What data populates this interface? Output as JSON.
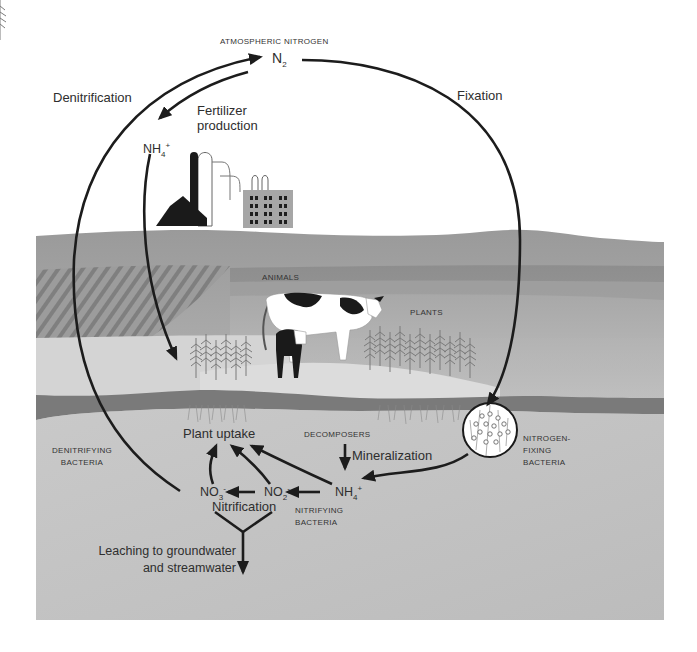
{
  "diagram": {
    "colors": {
      "background": "#ffffff",
      "hill_top": "#bdbdbd",
      "field": "#a9a9a9",
      "pasture": "#cfcfcf",
      "soil_band": "#7c7c7c",
      "soil": "#c4c4c4",
      "arrow": "#1c1c1c",
      "text": "#2e2e2e"
    },
    "labels": {
      "atmospheric_nitrogen": "ATMOSPHERIC NITROGEN",
      "n2": "N",
      "n2_sub": "2",
      "denitrification": "Denitrification",
      "fixation": "Fixation",
      "fertilizer_production_line1": "Fertilizer",
      "fertilizer_production_line2": "production",
      "nh4_fertilizer": "NH",
      "nh4_fertilizer_sub": "4",
      "nh4_fertilizer_sup": "+",
      "animals": "ANIMALS",
      "plants": "PLANTS",
      "plant_uptake": "Plant uptake",
      "decomposers": "DECOMPOSERS",
      "mineralization": "Mineralization",
      "nitrogen_fixing_bacteria_line1": "NITROGEN-",
      "nitrogen_fixing_bacteria_line2": "FIXING",
      "nitrogen_fixing_bacteria_line3": "BACTERIA",
      "denitrifying_bacteria_line1": "DENITRIFYING",
      "denitrifying_bacteria_line2": "BACTERIA",
      "no3": "NO",
      "no3_sub": "3",
      "no3_sup": "-",
      "no2": "NO",
      "no2_sub": "2",
      "no2_sup": "-",
      "nh4_soil": "NH",
      "nh4_soil_sub": "4",
      "nh4_soil_sup": "+",
      "nitrification": "Nitrification",
      "nitrifying_bacteria_line1": "NITRIFYING",
      "nitrifying_bacteria_line2": "BACTERIA",
      "leaching_line1": "Leaching to groundwater",
      "leaching_line2": "and streamwater"
    },
    "icons": [
      "factory-icon",
      "cow-icon",
      "calf-icon",
      "plant-icon",
      "bacteria-circle-icon",
      "arrow-icon"
    ],
    "flows": [
      {
        "from": "N2",
        "to": "NH4+ (fertilizer)",
        "label": "Fertilizer production"
      },
      {
        "from": "N2",
        "to": "Nitrogen-fixing bacteria",
        "label": "Fixation"
      },
      {
        "from": "NO3-",
        "to": "N2",
        "label": "Denitrification"
      },
      {
        "from": "NH4+ (fertilizer)",
        "to": "Plants"
      },
      {
        "from": "Nitrogen-fixing bacteria",
        "to": "NH4+"
      },
      {
        "from": "Decomposers",
        "to": "NH4+",
        "label": "Mineralization"
      },
      {
        "from": "NH4+",
        "to": "NO2-",
        "label": "Nitrification"
      },
      {
        "from": "NO2-",
        "to": "NO3-",
        "label": "Nitrification"
      },
      {
        "from": "NO3-",
        "to": "Plant uptake"
      },
      {
        "from": "NO2-",
        "to": "Plant uptake"
      },
      {
        "from": "NH4+",
        "to": "Plant uptake"
      },
      {
        "from": "NO3-/NO2-",
        "to": "Groundwater",
        "label": "Leaching to groundwater and streamwater"
      }
    ]
  }
}
